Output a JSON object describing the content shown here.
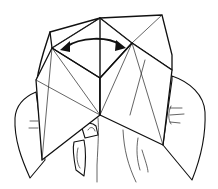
{
  "figure": {
    "annotation": {
      "type": "double-headed-curved-arrow",
      "meaning": "open and close the fortune teller side to side"
    },
    "colors": {
      "line": "#111111",
      "background": "#ffffff"
    }
  }
}
